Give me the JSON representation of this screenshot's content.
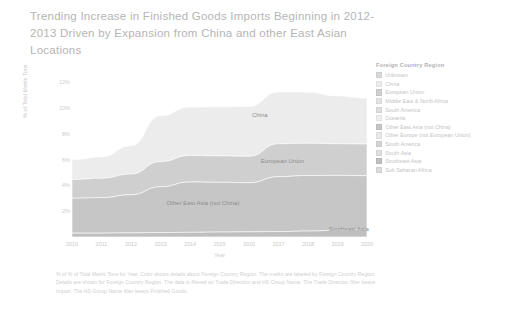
{
  "title": "Trending Increase in Finished Goods Imports Beginning in 2012-2013 Driven by Expansion from China and other East Asian Locations",
  "legend": {
    "title": "Foreign Country Region",
    "items": [
      {
        "label": "Unknown",
        "color": "#d9d9d9"
      },
      {
        "label": "China",
        "color": "#ececec"
      },
      {
        "label": "European Union",
        "color": "#cfcfcf"
      },
      {
        "label": "Middle East & North Africa",
        "color": "#e3e3e3"
      },
      {
        "label": "South America",
        "color": "#dedede"
      },
      {
        "label": "Oceania",
        "color": "#efefef"
      },
      {
        "label": "Other East Asia (not China)",
        "color": "#c6c6c6"
      },
      {
        "label": "Other Europe (not European Union)",
        "color": "#e8e8e8"
      },
      {
        "label": "South America",
        "color": "#d4d4d4"
      },
      {
        "label": "South Asia",
        "color": "#e0e0e0"
      },
      {
        "label": "Southeast Asia",
        "color": "#bfbfbf"
      },
      {
        "label": "Sub Saharan Africa",
        "color": "#dcdcdc"
      }
    ]
  },
  "footer": "% of % of Total Metric Tons for Year. Color shows details about Foreign Country Region.  The marks are labeled by Foreign Country Region.  Details are shown for Foreign Country Region. The data is filtered on Trade Direction and HS Group Name. The Trade Direction filter keeps Import. The HS Group Name filter keeps Finished Goods.",
  "chart_data": {
    "type": "area",
    "title": "Trending Increase in Finished Goods Imports Beginning in 2012-2013 Driven by Expansion from China and other East Asian Locations",
    "xlabel": "Year",
    "ylabel": "% of Total Metric Tons",
    "x": [
      2010,
      2011,
      2012,
      2013,
      2014,
      2015,
      2016,
      2017,
      2018,
      2019,
      2020
    ],
    "xtick_labels": [
      "2010",
      "2011",
      "2012",
      "2013",
      "2014",
      "2015",
      "2016",
      "2017",
      "2018",
      "2019",
      "2020"
    ],
    "ytick_labels": [
      "12%",
      "10%",
      "8%",
      "6%",
      "4%",
      "2%"
    ],
    "ytick_values": [
      12,
      10,
      8,
      6,
      4,
      2
    ],
    "ylim": [
      0,
      12
    ],
    "grid": false,
    "legend_position": "right",
    "stacked": true,
    "annotations": [
      {
        "text": "China",
        "x": 2016.1,
        "y": 9.4
      },
      {
        "text": "European Union",
        "x": 2016.4,
        "y": 5.8
      },
      {
        "text": "Other East Asia (not China)",
        "x": 2013.2,
        "y": 2.55
      },
      {
        "text": "Southeast Asia",
        "x": 2018.7,
        "y": 0.55
      }
    ],
    "series": [
      {
        "name": "Southeast Asia",
        "color": "#bfbfbf",
        "values": [
          0.3,
          0.3,
          0.32,
          0.34,
          0.36,
          0.38,
          0.4,
          0.42,
          0.46,
          0.52,
          0.55
        ]
      },
      {
        "name": "Other East Asia (not China)",
        "color": "#c6c6c6",
        "values": [
          2.7,
          2.75,
          2.95,
          3.55,
          3.9,
          3.85,
          3.8,
          4.25,
          4.3,
          4.25,
          4.2
        ]
      },
      {
        "name": "European Union",
        "color": "#cfcfcf",
        "values": [
          1.45,
          1.5,
          1.6,
          1.95,
          2.05,
          2.05,
          2.05,
          2.55,
          2.5,
          2.45,
          2.45
        ]
      },
      {
        "name": "China",
        "color": "#ececec",
        "values": [
          1.55,
          1.65,
          2.2,
          3.55,
          3.75,
          3.8,
          3.85,
          4.0,
          3.95,
          3.7,
          3.55
        ]
      }
    ]
  }
}
